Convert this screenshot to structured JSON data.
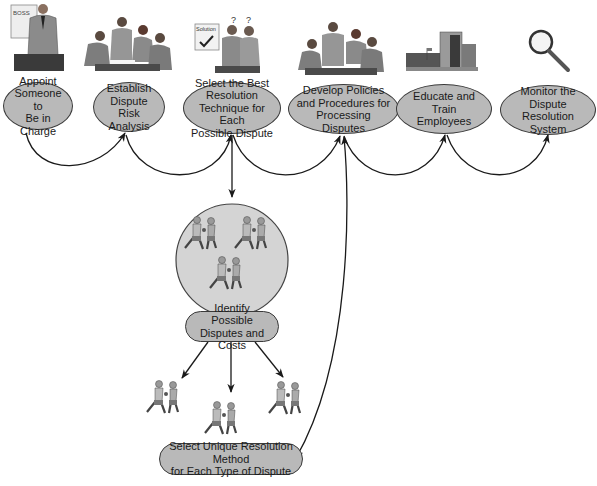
{
  "diagram": {
    "type": "process-flow",
    "colors": {
      "node_fill": "#b9b9b9",
      "node_border": "#3a3a3a",
      "arrow": "#1a1a1a",
      "circle_fill": "#d4d4d4",
      "background": "#ffffff"
    },
    "top_row": [
      {
        "id": "n1",
        "label": "Appoint Someone to Be in Charge",
        "lines": [
          "Appoint",
          "Someone to",
          "Be in Charge"
        ],
        "illustration": "boss-on-phone-icon",
        "illustration_text": "BOSS"
      },
      {
        "id": "n2",
        "label": "Establish Dispute Risk Analysis",
        "lines": [
          "Establish",
          "Dispute Risk",
          "Analysis"
        ],
        "illustration": "team-meeting-icon"
      },
      {
        "id": "n3",
        "label": "Select the Best Resolution Technique for Each Possible Dispute",
        "lines": [
          "Select the Best",
          "Resolution",
          "Technique for Each",
          "Possible Dispute"
        ],
        "illustration": "solution-board-icon",
        "illustration_text": "Solution",
        "illustration_marks": [
          "?",
          "?"
        ]
      },
      {
        "id": "n4",
        "label": "Develop Policies and Procedures for Processing Disputes",
        "lines": [
          "Develop Policies",
          "and Procedures for",
          "Processing Disputes"
        ],
        "illustration": "team-meeting-icon"
      },
      {
        "id": "n5",
        "label": "Educate and Train Employees",
        "lines": [
          "Educate and",
          "Train Employees"
        ],
        "illustration": "building-icon"
      },
      {
        "id": "n6",
        "label": "Monitor the Dispute Resolution System",
        "lines": [
          "Monitor the Dispute",
          "Resolution System"
        ],
        "illustration": "magnifying-glass-icon"
      }
    ],
    "sub_flow": {
      "circle_illustration": "boxers-group-icon",
      "identify": {
        "id": "n7",
        "label": "Identify Possible Disputes and Costs",
        "lines": [
          "Identify Possible",
          "Disputes and Costs"
        ]
      },
      "branch_illustrations": [
        "boxers-icon",
        "boxers-icon",
        "boxers-icon"
      ],
      "select_unique": {
        "id": "n8",
        "label": "Select Unique Resolution Method for Each Type of Dispute",
        "lines": [
          "Select Unique Resolution Method",
          "for Each Type of Dispute"
        ]
      }
    },
    "edges": [
      {
        "from": "n1",
        "to": "n2"
      },
      {
        "from": "n2",
        "to": "n3"
      },
      {
        "from": "n3",
        "to": "n4"
      },
      {
        "from": "n4",
        "to": "n5"
      },
      {
        "from": "n5",
        "to": "n6"
      },
      {
        "from": "n3",
        "to": "circle"
      },
      {
        "from": "n7",
        "to": "boxers-1"
      },
      {
        "from": "n7",
        "to": "boxers-2"
      },
      {
        "from": "n7",
        "to": "boxers-3"
      },
      {
        "from": "n4",
        "to": "n8",
        "bidirectional": true
      }
    ]
  }
}
